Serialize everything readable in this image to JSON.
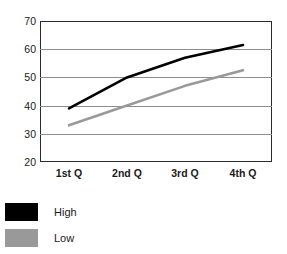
{
  "chart_data": {
    "type": "line",
    "title": "",
    "xlabel": "",
    "ylabel": "",
    "categories": [
      "1st Q",
      "2nd Q",
      "3rd Q",
      "4th Q"
    ],
    "series": [
      {
        "name": "High",
        "color": "#000000",
        "values": [
          39,
          50,
          57,
          61.5
        ]
      },
      {
        "name": "Low",
        "color": "#999999",
        "values": [
          33,
          40,
          47,
          52.5
        ]
      }
    ],
    "ylim": [
      20,
      70
    ],
    "yticks": [
      70,
      60,
      50,
      40,
      30,
      20
    ],
    "ytick_labels": [
      "70",
      "60",
      "50",
      "40",
      "30",
      "20"
    ],
    "grid": "horizontal",
    "legend_position": "bottom-left",
    "legend": [
      {
        "label": "High",
        "color": "#000000"
      },
      {
        "label": "Low",
        "color": "#999999"
      }
    ],
    "frame_color": "#2b2b2b",
    "gridline_color": "#8d8d8d",
    "background": "#ffffff"
  }
}
